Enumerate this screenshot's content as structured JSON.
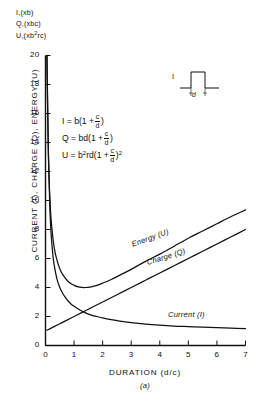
{
  "figure": {
    "caption": "(a)",
    "unit_annotations": [
      {
        "text": "I,(xb)",
        "symbol": "I,(xb)"
      },
      {
        "text": "Q,(xbc)",
        "symbol": "Q,(xbc)"
      },
      {
        "text": "U,(xb",
        "sup": "2",
        "tail": "rc)"
      }
    ],
    "equations": [
      {
        "lhs": "I =",
        "body": "b(1 +",
        "num": "c",
        "den": "d",
        "close": ")",
        "exp": ""
      },
      {
        "lhs": "Q =",
        "body": "bd(1 +",
        "num": "c",
        "den": "d",
        "close": ")",
        "exp": ""
      },
      {
        "lhs": "U =",
        "body": "b",
        "lhs_sup": "2",
        "body2": "rd(1 +",
        "num": "c",
        "den": "d",
        "close": ")",
        "exp": "2"
      }
    ],
    "inset": {
      "current_label": "I",
      "duration_label": "d"
    }
  },
  "chart_data": {
    "type": "line",
    "title": "",
    "xlabel": "DURATION (d/c)",
    "ylabel": "CURRENT (I), CHARGE (Q), ENERGY (U)",
    "xlim": [
      0,
      7
    ],
    "ylim": [
      0,
      20
    ],
    "xticks": [
      "0",
      "1",
      "2",
      "3",
      "4",
      "5",
      "6",
      "7"
    ],
    "yticks": [
      "0",
      "2",
      "4",
      "6",
      "8",
      "10",
      "12",
      "14",
      "16",
      "18",
      "20"
    ],
    "grid": false,
    "legend": "inline-curve-labels",
    "series": [
      {
        "name": "Current (I)",
        "label": "Current (I)",
        "color": "#111111",
        "x": [
          0.05,
          0.1,
          0.15,
          0.2,
          0.25,
          0.3,
          0.4,
          0.5,
          0.6,
          0.7,
          0.8,
          0.9,
          1.0,
          1.2,
          1.4,
          1.6,
          1.8,
          2.0,
          2.3,
          2.6,
          3.0,
          3.5,
          4.0,
          4.5,
          5.0,
          5.5,
          6.0,
          6.5,
          7.0
        ],
        "y": [
          20.0,
          13.5,
          9.6,
          7.6,
          6.4,
          5.6,
          4.6,
          4.0,
          3.6,
          3.3,
          3.05,
          2.85,
          2.7,
          2.45,
          2.25,
          2.1,
          2.0,
          1.9,
          1.78,
          1.68,
          1.58,
          1.48,
          1.4,
          1.34,
          1.3,
          1.26,
          1.23,
          1.2,
          1.17
        ]
      },
      {
        "name": "Charge (Q)",
        "label": "Charge (Q)",
        "color": "#111111",
        "x": [
          0.05,
          0.1,
          0.2,
          0.3,
          0.5,
          0.7,
          1.0,
          1.3,
          1.6,
          2.0,
          2.5,
          3.0,
          3.5,
          4.0,
          4.5,
          5.0,
          5.5,
          6.0,
          6.5,
          7.0
        ],
        "y": [
          1.05,
          1.1,
          1.2,
          1.3,
          1.5,
          1.7,
          2.0,
          2.3,
          2.6,
          3.0,
          3.5,
          4.0,
          4.5,
          5.0,
          5.5,
          6.0,
          6.5,
          7.0,
          7.5,
          8.0
        ]
      },
      {
        "name": "Energy (U)",
        "label": "Energy (U)",
        "color": "#111111",
        "x": [
          0.05,
          0.1,
          0.15,
          0.2,
          0.3,
          0.4,
          0.5,
          0.6,
          0.8,
          1.0,
          1.2,
          1.4,
          1.6,
          1.8,
          2.0,
          2.3,
          2.6,
          3.0,
          3.5,
          4.0,
          4.5,
          5.0,
          5.5,
          6.0,
          6.5,
          7.0
        ],
        "y": [
          20.0,
          13.2,
          10.3,
          8.6,
          6.8,
          5.9,
          5.3,
          4.9,
          4.4,
          4.15,
          4.02,
          4.0,
          4.05,
          4.15,
          4.3,
          4.55,
          4.85,
          5.25,
          5.8,
          6.3,
          6.85,
          7.4,
          7.9,
          8.4,
          8.9,
          9.35
        ]
      }
    ],
    "annotations": [
      "I,(xb)",
      "Q,(xbc)",
      "U,(xb2rc)",
      "I = b(1 + c/d)",
      "Q = bd(1 + c/d)",
      "U = b2rd(1 + c/d)2"
    ]
  }
}
